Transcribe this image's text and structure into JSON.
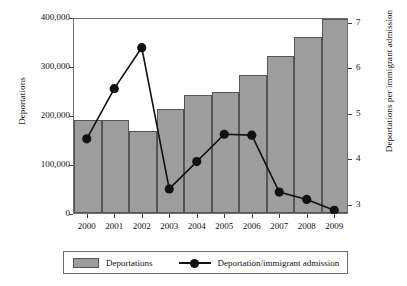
{
  "chart_data": {
    "type": "bar",
    "title": "",
    "subtitle": "",
    "xlabel": "",
    "ylabel": "Deportations",
    "y2label": "Deportations per immigrant admission",
    "categories": [
      "2000",
      "2001",
      "2002",
      "2003",
      "2004",
      "2005",
      "2006",
      "2007",
      "2008",
      "2009"
    ],
    "ylim": [
      0,
      400000
    ],
    "y2lim": [
      2.8,
      7.1
    ],
    "grid": false,
    "legend_position": "below-plot",
    "yticks": [
      0,
      100000,
      200000,
      300000,
      400000
    ],
    "ytick_labels": [
      "0",
      "100,000",
      "200,000",
      "300,000",
      "400,000"
    ],
    "y2ticks": [
      3,
      4,
      5,
      6,
      7
    ],
    "y2tick_labels": [
      "3",
      "4",
      "5",
      "6",
      "7"
    ],
    "series": [
      {
        "name": "Deportations",
        "type": "bar",
        "axis": "left",
        "color": "#9d9d9d",
        "edge_color": "#555555",
        "values": [
          190000,
          190000,
          167000,
          212000,
          241000,
          246000,
          281000,
          320000,
          359000,
          395000
        ]
      },
      {
        "name": "Deportation/immigrant admission",
        "type": "line",
        "axis": "right",
        "color": "#111111",
        "marker": "filled-circle",
        "values": [
          4.45,
          5.55,
          6.45,
          3.35,
          3.95,
          4.55,
          4.53,
          3.28,
          3.12,
          2.88
        ]
      }
    ]
  },
  "axes": {
    "left_title": "Deportations",
    "right_title": "Deportations per immigrant admission"
  },
  "legend": {
    "bars_label": "Deportations",
    "line_label": "Deportation/immigrant admission"
  }
}
